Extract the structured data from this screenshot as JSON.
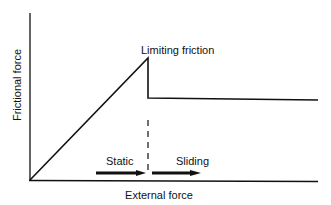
{
  "diagram": {
    "type": "friction-force-graph",
    "labels": {
      "y_axis": "Frictional force",
      "x_axis": "External force",
      "peak": "Limiting friction",
      "static_region": "Static",
      "sliding_region": "Sliding"
    },
    "colors": {
      "line": "#111111",
      "background": "#ffffff"
    },
    "geometry": {
      "origin": [
        30,
        180
      ],
      "y_axis_top": 13,
      "x_axis_end": 318,
      "peak": [
        148,
        58
      ],
      "drop_level": 98,
      "plateau_end": [
        318,
        100
      ]
    }
  }
}
